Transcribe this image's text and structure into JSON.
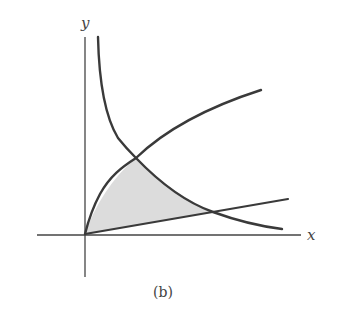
{
  "figure": {
    "caption": "(b)",
    "axes": {
      "x_label": "x",
      "y_label": "y",
      "origin_px": [
        85,
        234
      ]
    },
    "curves": [
      {
        "name": "square-root-curve",
        "description": "increasing concave curve through origin, y ≈ k·√x",
        "points_px": [
          [
            85,
            234
          ],
          [
            136,
            158
          ],
          [
            261,
            90
          ]
        ]
      },
      {
        "name": "line-through-origin",
        "description": "straight line through origin with small positive slope",
        "points_px": [
          [
            85,
            234
          ],
          [
            213,
            212
          ],
          [
            288,
            199
          ]
        ]
      },
      {
        "name": "hyperbola-curve",
        "description": "decreasing convex curve, asymptotic to the y-axis",
        "points_px": [
          [
            98,
            37
          ],
          [
            136,
            158
          ],
          [
            213,
            212
          ],
          [
            282,
            229
          ]
        ]
      }
    ],
    "shaded_region": {
      "description": "region bounded by the square-root curve, the hyperbola and the line, with vertices at origin and the two intersections",
      "vertices_px": [
        [
          85,
          234
        ],
        [
          136,
          158
        ],
        [
          213,
          212
        ]
      ],
      "fill": "#d9d9d9"
    },
    "colors": {
      "curve": "#3a3a3a",
      "axis": "#444444",
      "shade": "#dcdcdc"
    }
  }
}
